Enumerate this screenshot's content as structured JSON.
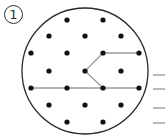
{
  "label": "1",
  "colors": {
    "circle": "#2a2a2a",
    "dot": "#111111",
    "path": "#9a9a9a",
    "dash": "#777777"
  },
  "circle": {
    "cx": 85,
    "cy": 71,
    "r": 63
  },
  "dots": [
    [
      67,
      20
    ],
    [
      103,
      20
    ],
    [
      49,
      36
    ],
    [
      85,
      36
    ],
    [
      121,
      36
    ],
    [
      31,
      53
    ],
    [
      67,
      53
    ],
    [
      103,
      53
    ],
    [
      139,
      53
    ],
    [
      49,
      71
    ],
    [
      85,
      71
    ],
    [
      121,
      71
    ],
    [
      31,
      88
    ],
    [
      67,
      88
    ],
    [
      103,
      88
    ],
    [
      139,
      88
    ],
    [
      49,
      105
    ],
    [
      85,
      105
    ],
    [
      121,
      105
    ],
    [
      67,
      122
    ],
    [
      103,
      122
    ]
  ],
  "paths": [
    [
      [
        139,
        53
      ],
      [
        103,
        53
      ],
      [
        85,
        71
      ],
      [
        103,
        88
      ]
    ],
    [
      [
        31,
        88
      ],
      [
        139,
        88
      ]
    ]
  ],
  "answer_lines": [
    {
      "y": 75,
      "x1": 153,
      "x2": 165
    },
    {
      "y": 89,
      "x1": 153,
      "x2": 165
    },
    {
      "y": 108,
      "x1": 153,
      "x2": 165
    },
    {
      "y": 123,
      "x1": 153,
      "x2": 165
    }
  ]
}
